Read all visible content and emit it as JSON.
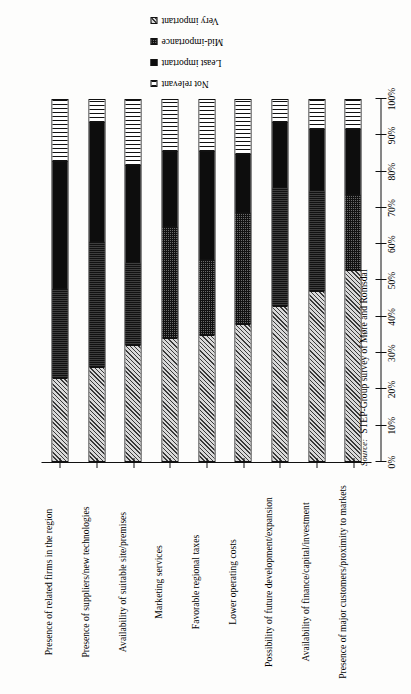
{
  "figure": {
    "source_label": "Source:",
    "source_text": "STEP-Group survey of Møre and Romsdal"
  },
  "legend": {
    "entries": [
      {
        "label": "Not relevant",
        "pattern": "horizontal-lines"
      },
      {
        "label": "Least important",
        "pattern": "solid-black"
      },
      {
        "label": "Mid-importance",
        "pattern": "fine-stipple"
      },
      {
        "label": "Very important",
        "pattern": "diagonal-hatch"
      }
    ]
  },
  "chart_data": {
    "type": "bar",
    "orientation": "horizontal-stacked",
    "title": "",
    "subtitle": "",
    "xlabel": "",
    "ylabel": "",
    "xlim": [
      0,
      100
    ],
    "grid": false,
    "legend_position": "top-right",
    "stacked_total": 100,
    "tick_labels": [
      "0%",
      "10%",
      "20%",
      "30%",
      "40%",
      "50%",
      "60%",
      "70%",
      "80%",
      "90%",
      "100%"
    ],
    "tick_values": [
      0,
      10,
      20,
      30,
      40,
      50,
      60,
      70,
      80,
      90,
      100
    ],
    "categories": [
      "Presence of related firms in the region",
      "Presence of suppliers/new technologies",
      "Availability of suitable site/premises",
      "Marketing services",
      "Favorable regional taxes",
      "Lower operating costs",
      "Possibility of future development/expansion",
      "Availability of finance/capital/investment",
      "Presence of major customers/proximity to markets"
    ],
    "series": [
      {
        "name": "Very important",
        "pattern": "diagonal-hatch",
        "values": [
          23,
          26,
          32,
          34,
          35,
          38,
          43,
          47,
          53
        ]
      },
      {
        "name": "Mid-importance",
        "pattern": "fine-stipple",
        "values": [
          25,
          35,
          23,
          31,
          21,
          31,
          33,
          28,
          21
        ]
      },
      {
        "name": "Least important",
        "pattern": "solid-black",
        "values": [
          35,
          33,
          27,
          21,
          30,
          16,
          18,
          17,
          18
        ]
      },
      {
        "name": "Not relevant",
        "pattern": "horizontal-lines",
        "values": [
          17,
          6,
          18,
          14,
          14,
          15,
          6,
          8,
          8
        ]
      }
    ]
  }
}
